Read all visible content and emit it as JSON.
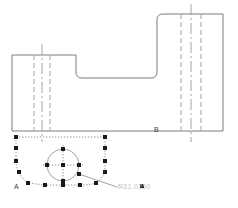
{
  "drawing": {
    "title": "CAD part profile with selected spline",
    "labels": {
      "section_a": "A",
      "section_b": "B",
      "dimension": "R31.0250"
    },
    "colors": {
      "outline": "#6e6e6e",
      "hidden_line": "#9a9a9a",
      "center_line": "#9a9a9a",
      "grip": "#1a1a1a",
      "selection_dotted": "#7d7d7d",
      "dim_text": "#c3c3c3",
      "label_text": "#3b3b3b",
      "background": "#ffffff"
    },
    "outline_profile": {
      "type": "polyline-with-fillets",
      "points": "12,55 12,131 223,131 223,14 157,14 157,78 76,78 76,55",
      "fillet_radius": 6
    },
    "hidden_lines": {
      "left_group": {
        "x": [
          34,
          50
        ],
        "y_top": 55,
        "y_bottom": 131
      },
      "right_group": {
        "x": [
          181,
          201
        ],
        "y_top": 14,
        "y_bottom": 131
      }
    },
    "center_lines": {
      "left": {
        "x": 42,
        "y_top": 44,
        "y_bottom": 142
      },
      "right": {
        "x": 191,
        "y_top": 4,
        "y_bottom": 142
      }
    },
    "circle": {
      "center_x": 63,
      "center_y": 165,
      "radius": 16,
      "crosshair": true
    },
    "spline": {
      "description": "selected closed spline with grip squares",
      "grip_size": 4
    },
    "grips": [
      {
        "name": "grip-top-left-corner",
        "x": 16,
        "y": 137
      },
      {
        "name": "grip-left-upper",
        "x": 16,
        "y": 148
      },
      {
        "name": "grip-left-mid",
        "x": 16,
        "y": 161
      },
      {
        "name": "grip-left-lower",
        "x": 19,
        "y": 172
      },
      {
        "name": "grip-bottom-left",
        "x": 28,
        "y": 183
      },
      {
        "name": "grip-bottom-mid-left",
        "x": 45,
        "y": 185
      },
      {
        "name": "grip-bottom-center",
        "x": 63,
        "y": 185
      },
      {
        "name": "grip-bottom-mid-right",
        "x": 80,
        "y": 185
      },
      {
        "name": "grip-bottom-right",
        "x": 96,
        "y": 183
      },
      {
        "name": "grip-right-lower",
        "x": 105,
        "y": 172
      },
      {
        "name": "grip-right-mid",
        "x": 105,
        "y": 161
      },
      {
        "name": "grip-right-upper",
        "x": 105,
        "y": 148
      },
      {
        "name": "grip-top-right-corner",
        "x": 105,
        "y": 137
      },
      {
        "name": "grip-circle-north",
        "x": 63,
        "y": 149
      },
      {
        "name": "grip-circle-west",
        "x": 47,
        "y": 165
      },
      {
        "name": "grip-circle-center",
        "x": 63,
        "y": 165
      },
      {
        "name": "grip-circle-east",
        "x": 79,
        "y": 165
      },
      {
        "name": "grip-circle-south",
        "x": 63,
        "y": 181
      },
      {
        "name": "grip-leader-anchor",
        "x": 79,
        "y": 174
      }
    ],
    "leader_line": {
      "from_x": 79,
      "from_y": 174,
      "to_x": 117,
      "to_y": 187
    }
  }
}
